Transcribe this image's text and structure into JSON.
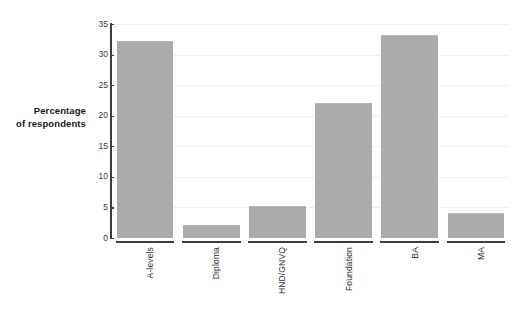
{
  "chart_data": {
    "type": "bar",
    "title": "",
    "subtitle": "",
    "xlabel": "",
    "ylabel": "Percentage of respondents",
    "ylabel_lines": [
      "Percentage",
      "of respondents"
    ],
    "categories": [
      "A-levels",
      "Diploma",
      "HND/GNVQ",
      "Foundation",
      "BA",
      "MA"
    ],
    "values": [
      32,
      2,
      5,
      22,
      33,
      4
    ],
    "ylim": [
      0,
      35
    ],
    "y_ticks": [
      35,
      30,
      25,
      20,
      15,
      10,
      5,
      0
    ],
    "y_tick_labels": [
      "35",
      "30",
      "25",
      "20",
      "15",
      "10",
      "5",
      "0"
    ],
    "grid": true,
    "legend": false,
    "legend_position": "none",
    "bar_color": "#ababab",
    "axis_color": "#3c3c3c",
    "grid_color": "#f0eeee",
    "background_color": "#ffffff"
  }
}
